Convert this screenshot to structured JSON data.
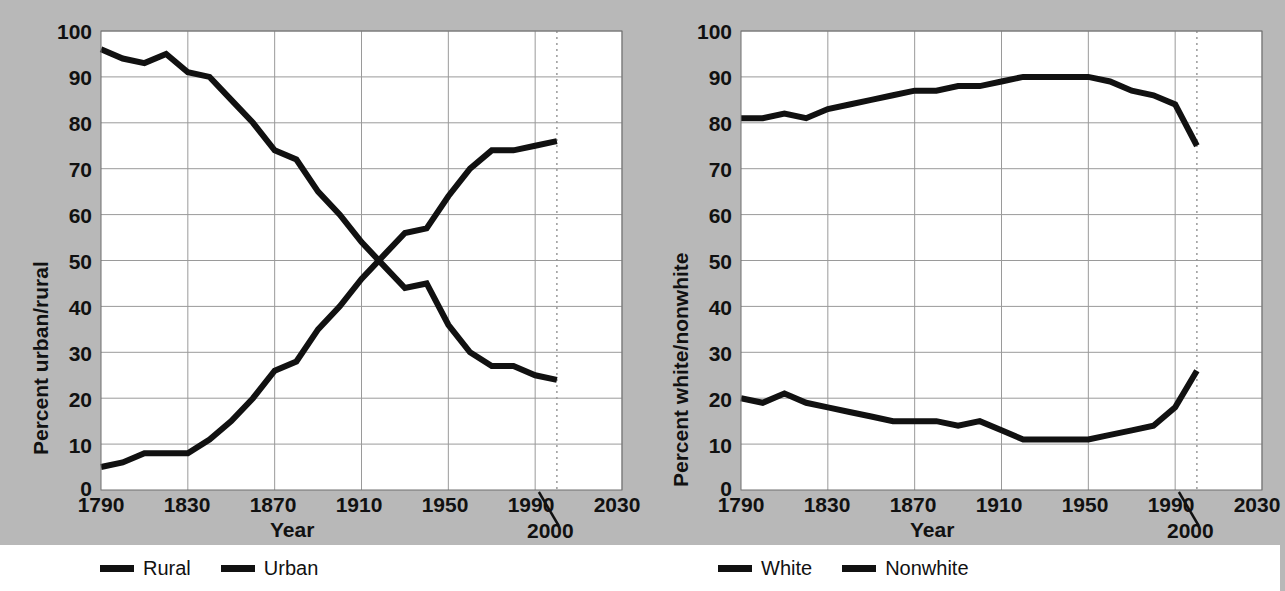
{
  "figure": {
    "background_color": "#b8b8b8",
    "plot_background_color": "#ffffff",
    "line_color": "#111111",
    "grid_color": "#9a9a9a",
    "projection_marker_label": "2000"
  },
  "charts": [
    {
      "id": "urban-rural",
      "ylabel": "Percent urban/rural",
      "xlabel": "Year",
      "yticks": [
        "0",
        "10",
        "20",
        "30",
        "40",
        "50",
        "60",
        "70",
        "80",
        "90",
        "100"
      ],
      "xticks": [
        "1790",
        "1830",
        "1870",
        "1910",
        "1950",
        "1990",
        "2030"
      ],
      "callout": "2000",
      "legend": [
        {
          "label": "Rural",
          "color": "#111111"
        },
        {
          "label": "Urban",
          "color": "#111111"
        }
      ]
    },
    {
      "id": "white-nonwhite",
      "ylabel": "Percent white/nonwhite",
      "xlabel": "Year",
      "yticks": [
        "0",
        "10",
        "20",
        "30",
        "40",
        "50",
        "60",
        "70",
        "80",
        "90",
        "100"
      ],
      "xticks": [
        "1790",
        "1830",
        "1870",
        "1910",
        "1950",
        "1990",
        "2030"
      ],
      "callout": "2000",
      "legend": [
        {
          "label": "White",
          "color": "#111111"
        },
        {
          "label": "Nonwhite",
          "color": "#111111"
        }
      ]
    }
  ],
  "chart_data": [
    {
      "type": "line",
      "title": "",
      "xlabel": "Year",
      "ylabel": "Percent urban/rural",
      "xlim": [
        1790,
        2030
      ],
      "ylim": [
        0,
        100
      ],
      "xticks": [
        1790,
        1830,
        1870,
        1910,
        1950,
        1990,
        2030
      ],
      "yticks": [
        0,
        10,
        20,
        30,
        40,
        50,
        60,
        70,
        80,
        90,
        100
      ],
      "grid": true,
      "legend_position": "bottom",
      "annotations": [
        {
          "text": "2000",
          "x": 2000,
          "type": "projection-line",
          "style": "dotted-vertical"
        }
      ],
      "x": [
        1790,
        1800,
        1810,
        1820,
        1830,
        1840,
        1850,
        1860,
        1870,
        1880,
        1890,
        1900,
        1910,
        1920,
        1930,
        1940,
        1950,
        1960,
        1970,
        1980,
        1990,
        2000
      ],
      "series": [
        {
          "name": "Rural",
          "values": [
            96,
            94,
            93,
            95,
            91,
            90,
            85,
            80,
            74,
            72,
            65,
            60,
            54,
            49,
            44,
            45,
            36,
            30,
            27,
            27,
            25,
            24
          ]
        },
        {
          "name": "Urban",
          "values": [
            5,
            6,
            8,
            8,
            8,
            11,
            15,
            20,
            26,
            28,
            35,
            40,
            46,
            51,
            56,
            57,
            64,
            70,
            74,
            74,
            75,
            76
          ]
        }
      ]
    },
    {
      "type": "line",
      "title": "",
      "xlabel": "Year",
      "ylabel": "Percent white/nonwhite",
      "xlim": [
        1790,
        2030
      ],
      "ylim": [
        0,
        100
      ],
      "xticks": [
        1790,
        1830,
        1870,
        1910,
        1950,
        1990,
        2030
      ],
      "yticks": [
        0,
        10,
        20,
        30,
        40,
        50,
        60,
        70,
        80,
        90,
        100
      ],
      "grid": true,
      "legend_position": "bottom",
      "annotations": [
        {
          "text": "2000",
          "x": 2000,
          "type": "projection-line",
          "style": "dotted-vertical"
        }
      ],
      "x": [
        1790,
        1800,
        1810,
        1820,
        1830,
        1840,
        1850,
        1860,
        1870,
        1880,
        1890,
        1900,
        1910,
        1920,
        1930,
        1940,
        1950,
        1960,
        1970,
        1980,
        1990,
        2000
      ],
      "series": [
        {
          "name": "White",
          "values": [
            81,
            81,
            82,
            81,
            83,
            84,
            85,
            86,
            87,
            87,
            88,
            88,
            89,
            90,
            90,
            90,
            90,
            89,
            87,
            86,
            84,
            75
          ]
        },
        {
          "name": "Nonwhite",
          "values": [
            20,
            19,
            21,
            19,
            18,
            17,
            16,
            15,
            15,
            15,
            14,
            15,
            13,
            11,
            11,
            11,
            11,
            12,
            13,
            14,
            18,
            26
          ]
        }
      ]
    }
  ]
}
